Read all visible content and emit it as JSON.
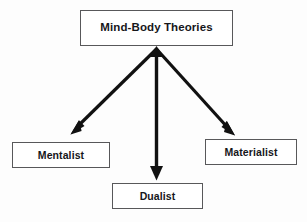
{
  "diagram": {
    "title": "Mind-Body Theories",
    "type": "hierarchy-tree",
    "background_color": "#fdfdfd",
    "line_color": "#111111",
    "box_border_color": "#58585a",
    "text_color": "#16161a",
    "root": {
      "label": "Mind-Body Theories"
    },
    "children": [
      {
        "id": "mentalist",
        "label": "Mentalist"
      },
      {
        "id": "dualist",
        "label": "Dualist"
      },
      {
        "id": "materialist",
        "label": "Materialist"
      }
    ],
    "edges": [
      {
        "from": "Mind-Body Theories",
        "to": "Mentalist",
        "direction": "down-left",
        "style": "solid-arrow"
      },
      {
        "from": "Mind-Body Theories",
        "to": "Dualist",
        "direction": "down",
        "style": "solid-arrow"
      },
      {
        "from": "Mind-Body Theories",
        "to": "Materialist",
        "direction": "down-right",
        "style": "solid-arrow"
      }
    ]
  }
}
